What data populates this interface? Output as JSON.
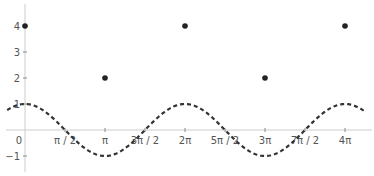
{
  "chart_data": {
    "type": "scatter",
    "title": "",
    "xlabel": "",
    "ylabel": "",
    "xlim": [
      -0.7,
      13.2
    ],
    "ylim": [
      -1.5,
      5
    ],
    "grid": false,
    "x_ticks": [
      {
        "value": 0,
        "label": "0"
      },
      {
        "value": 1.5708,
        "label": "π / 2"
      },
      {
        "value": 3.1416,
        "label": "π"
      },
      {
        "value": 4.7124,
        "label": "3π / 2"
      },
      {
        "value": 6.2832,
        "label": "2π"
      },
      {
        "value": 7.854,
        "label": "5π / 2"
      },
      {
        "value": 9.4248,
        "label": "3π"
      },
      {
        "value": 10.9956,
        "label": "7π / 2"
      },
      {
        "value": 12.5664,
        "label": "4π"
      }
    ],
    "y_ticks": [
      {
        "value": -1,
        "label": "−1"
      },
      {
        "value": 1,
        "label": "1"
      },
      {
        "value": 2,
        "label": "2"
      },
      {
        "value": 3,
        "label": "3"
      },
      {
        "value": 4,
        "label": "4"
      }
    ],
    "series": [
      {
        "name": "points",
        "type": "scatter",
        "x": [
          0,
          3.1416,
          6.2832,
          9.4248,
          12.5664
        ],
        "y": [
          4,
          2,
          4,
          2,
          4
        ],
        "color": "#222222"
      },
      {
        "name": "cos(x)",
        "type": "line",
        "style": "dashed",
        "function": "cos(x)",
        "x_range": [
          -0.7,
          13.3
        ],
        "color": "#333333"
      }
    ]
  }
}
